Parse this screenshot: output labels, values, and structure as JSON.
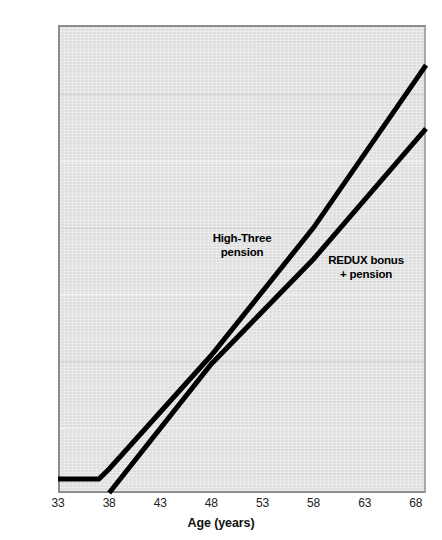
{
  "chart_data": {
    "type": "line",
    "title": "",
    "xlabel": "Age (years)",
    "ylabel": "",
    "xlim": [
      33,
      69
    ],
    "ylim": [
      0,
      700000
    ],
    "grid": true,
    "legend_position": "inline-annotation",
    "x_ticks": [
      "33",
      "38",
      "43",
      "48",
      "53",
      "58",
      "63",
      "68"
    ],
    "x_tick_values": [
      33,
      38,
      43,
      48,
      53,
      58,
      63,
      68
    ],
    "y_ticks": [
      "$0",
      "$100,000",
      "$200,000",
      "$300,000",
      "$400,000",
      "$500,000",
      "$600,000",
      "$700,000"
    ],
    "y_tick_values": [
      0,
      100000,
      200000,
      300000,
      400000,
      500000,
      600000,
      700000
    ],
    "series": [
      {
        "name": "High-Three pension",
        "label": "High-Three\npension",
        "color": "#000000",
        "x": [
          33,
          37,
          38,
          48,
          58,
          69
        ],
        "values": [
          21000,
          21000,
          36000,
          206000,
          397000,
          640000
        ]
      },
      {
        "name": "REDUX bonus + pension",
        "label": "REDUX bonus\n+ pension",
        "color": "#000000",
        "x": [
          38,
          48,
          58,
          69
        ],
        "values": [
          0,
          193000,
          350000,
          545000
        ]
      }
    ],
    "annotations": [
      {
        "text": "High-Three\npension",
        "x": 47,
        "y": 330000
      },
      {
        "text": "REDUX bonus\n+ pension",
        "x": 58,
        "y": 300000
      }
    ],
    "colors": {
      "plot_background": "#e4e4e4",
      "line": "#000000",
      "gridline": "#d2d2d2",
      "axis": "#8d8d8d",
      "text": "#222222"
    }
  },
  "axis": {
    "x_title": "Age (years)"
  }
}
